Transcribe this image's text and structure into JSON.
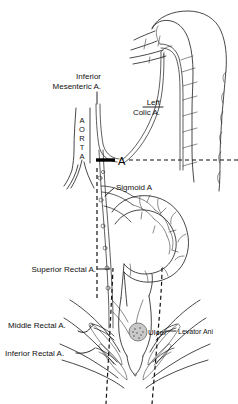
{
  "figure": {
    "background_color": "#ffffff",
    "ink_color": "#1a1a1a",
    "width": 238,
    "height": 404
  },
  "labels": {
    "inferior_mesenteric_line1": "Inferior",
    "inferior_mesenteric_line2": "Mesenteric A.",
    "left_colic_line1": "Left",
    "left_colic_line2": "Colic A.",
    "aorta_letters": [
      "A",
      "O",
      "R",
      "T",
      "A"
    ],
    "aorta_text": "AORTA",
    "level_marker": "A",
    "sigmoid": "Sigmoid A",
    "superior_rectal": "Superior Rectal A.",
    "middle_rectal": "Middle Rectal A.",
    "inferior_rectal": "Inferior Rectal A.",
    "ulcer": "Ulcer",
    "levator_ani": "Levator Ani"
  },
  "annotations": {
    "level_line_style": "dashed",
    "level_line_y": 160,
    "anal_canal_guides": "dashed"
  }
}
